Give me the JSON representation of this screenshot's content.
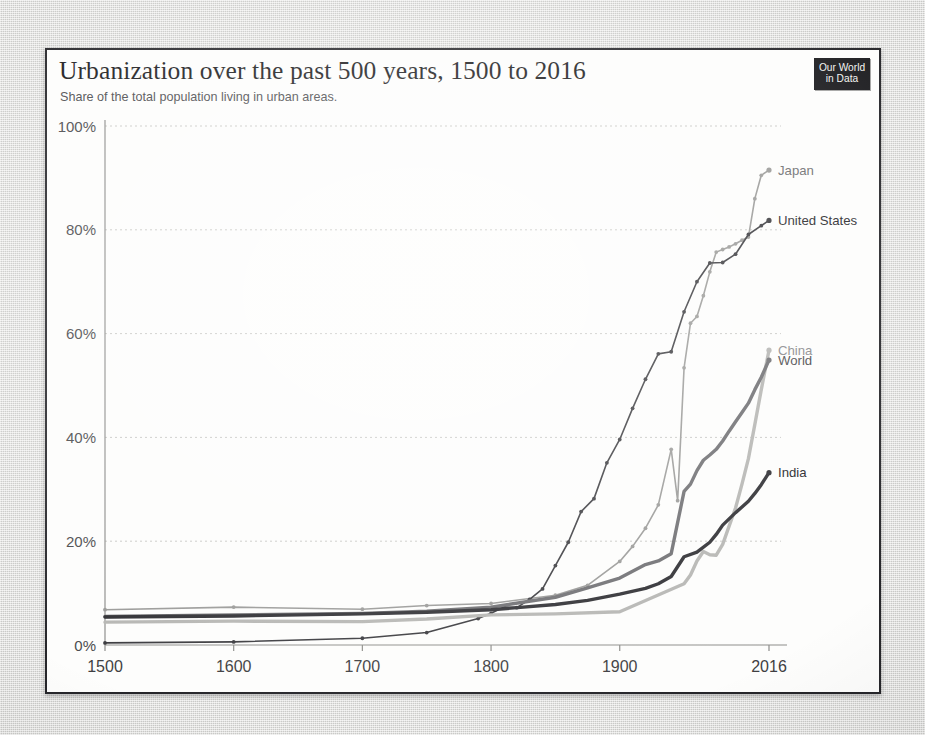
{
  "header": {
    "title": "Urbanization over the past 500 years, 1500 to 2016",
    "subtitle": "Share of the total population living in urban areas.",
    "logo_line1": "Our World",
    "logo_line2": "in Data"
  },
  "chart_data": {
    "type": "line",
    "title": "Urbanization over the past 500 years, 1500 to 2016",
    "subtitle": "Share of the total population living in urban areas.",
    "xlabel": "",
    "ylabel": "",
    "xlim": [
      1500,
      2016
    ],
    "ylim": [
      0,
      100
    ],
    "grid": true,
    "legend_position": "right-end-labels",
    "y_ticks": [
      "0%",
      "20%",
      "40%",
      "60%",
      "80%",
      "100%"
    ],
    "y_tick_values": [
      0,
      20,
      40,
      60,
      80,
      100
    ],
    "x_ticks": [
      "1500",
      "1600",
      "1700",
      "1800",
      "1900",
      "2016"
    ],
    "x_tick_values": [
      1500,
      1600,
      1700,
      1800,
      1900,
      2016
    ],
    "series": [
      {
        "name": "Japan",
        "color": "#9a9a98",
        "width": 1.6,
        "markers": true,
        "label_color": "#6e6e70",
        "points": [
          [
            1500,
            6.8
          ],
          [
            1600,
            7.3
          ],
          [
            1700,
            6.9
          ],
          [
            1750,
            7.6
          ],
          [
            1800,
            8.0
          ],
          [
            1850,
            9.6
          ],
          [
            1875,
            11.5
          ],
          [
            1900,
            16.1
          ],
          [
            1910,
            19.0
          ],
          [
            1920,
            22.5
          ],
          [
            1930,
            27.0
          ],
          [
            1940,
            37.7
          ],
          [
            1945,
            27.8
          ],
          [
            1950,
            53.4
          ],
          [
            1955,
            62.0
          ],
          [
            1960,
            63.3
          ],
          [
            1965,
            67.3
          ],
          [
            1970,
            71.9
          ],
          [
            1975,
            75.7
          ],
          [
            1980,
            76.2
          ],
          [
            1985,
            76.7
          ],
          [
            1990,
            77.3
          ],
          [
            1995,
            78.0
          ],
          [
            2000,
            78.6
          ],
          [
            2005,
            86.0
          ],
          [
            2010,
            90.5
          ],
          [
            2016,
            91.5
          ]
        ]
      },
      {
        "name": "United States",
        "color": "#3a3a3e",
        "width": 1.6,
        "markers": true,
        "label_color": "#2a2a2d",
        "points": [
          [
            1500,
            0.4
          ],
          [
            1600,
            0.6
          ],
          [
            1700,
            1.3
          ],
          [
            1750,
            2.4
          ],
          [
            1790,
            5.1
          ],
          [
            1800,
            6.1
          ],
          [
            1810,
            7.3
          ],
          [
            1820,
            7.2
          ],
          [
            1830,
            8.8
          ],
          [
            1840,
            10.8
          ],
          [
            1850,
            15.3
          ],
          [
            1860,
            19.8
          ],
          [
            1870,
            25.7
          ],
          [
            1880,
            28.2
          ],
          [
            1890,
            35.1
          ],
          [
            1900,
            39.6
          ],
          [
            1910,
            45.6
          ],
          [
            1920,
            51.2
          ],
          [
            1930,
            56.1
          ],
          [
            1940,
            56.5
          ],
          [
            1950,
            64.2
          ],
          [
            1960,
            70.0
          ],
          [
            1970,
            73.6
          ],
          [
            1980,
            73.7
          ],
          [
            1990,
            75.3
          ],
          [
            2000,
            79.1
          ],
          [
            2010,
            80.8
          ],
          [
            2016,
            81.8
          ]
        ]
      },
      {
        "name": "China",
        "color": "#b6b6b3",
        "width": 3.4,
        "markers": false,
        "label_color": "#8a8a8c",
        "points": [
          [
            1500,
            4.4
          ],
          [
            1600,
            4.6
          ],
          [
            1700,
            4.5
          ],
          [
            1750,
            5.0
          ],
          [
            1800,
            5.8
          ],
          [
            1850,
            6.0
          ],
          [
            1900,
            6.4
          ],
          [
            1950,
            11.8
          ],
          [
            1955,
            13.5
          ],
          [
            1960,
            16.2
          ],
          [
            1965,
            18.0
          ],
          [
            1970,
            17.4
          ],
          [
            1975,
            17.3
          ],
          [
            1980,
            19.4
          ],
          [
            1985,
            22.9
          ],
          [
            1990,
            26.4
          ],
          [
            1995,
            31.0
          ],
          [
            2000,
            35.9
          ],
          [
            2005,
            42.5
          ],
          [
            2010,
            49.2
          ],
          [
            2016,
            56.8
          ]
        ]
      },
      {
        "name": "World",
        "color": "#6f6f72",
        "width": 3.4,
        "markers": false,
        "label_color": "#4a4a4d",
        "points": [
          [
            1500,
            5.5
          ],
          [
            1600,
            5.8
          ],
          [
            1700,
            6.1
          ],
          [
            1750,
            6.5
          ],
          [
            1800,
            7.3
          ],
          [
            1850,
            9.2
          ],
          [
            1875,
            11.0
          ],
          [
            1900,
            12.9
          ],
          [
            1920,
            15.5
          ],
          [
            1930,
            16.2
          ],
          [
            1940,
            17.6
          ],
          [
            1950,
            29.6
          ],
          [
            1955,
            31.0
          ],
          [
            1960,
            33.6
          ],
          [
            1965,
            35.6
          ],
          [
            1970,
            36.6
          ],
          [
            1975,
            37.7
          ],
          [
            1980,
            39.3
          ],
          [
            1985,
            41.2
          ],
          [
            1990,
            43.0
          ],
          [
            1995,
            44.8
          ],
          [
            2000,
            46.6
          ],
          [
            2005,
            49.2
          ],
          [
            2010,
            51.6
          ],
          [
            2016,
            54.9
          ]
        ]
      },
      {
        "name": "India",
        "color": "#2f2f33",
        "width": 3.4,
        "markers": false,
        "label_color": "#242427",
        "points": [
          [
            1500,
            5.4
          ],
          [
            1600,
            5.6
          ],
          [
            1700,
            6.0
          ],
          [
            1750,
            6.3
          ],
          [
            1800,
            6.8
          ],
          [
            1850,
            7.8
          ],
          [
            1875,
            8.6
          ],
          [
            1900,
            9.8
          ],
          [
            1920,
            10.9
          ],
          [
            1930,
            11.8
          ],
          [
            1940,
            13.2
          ],
          [
            1950,
            17.0
          ],
          [
            1960,
            17.9
          ],
          [
            1970,
            19.8
          ],
          [
            1975,
            21.3
          ],
          [
            1980,
            23.1
          ],
          [
            1985,
            24.3
          ],
          [
            1990,
            25.5
          ],
          [
            1995,
            26.6
          ],
          [
            2000,
            27.7
          ],
          [
            2005,
            29.2
          ],
          [
            2010,
            30.9
          ],
          [
            2016,
            33.2
          ]
        ]
      }
    ]
  }
}
